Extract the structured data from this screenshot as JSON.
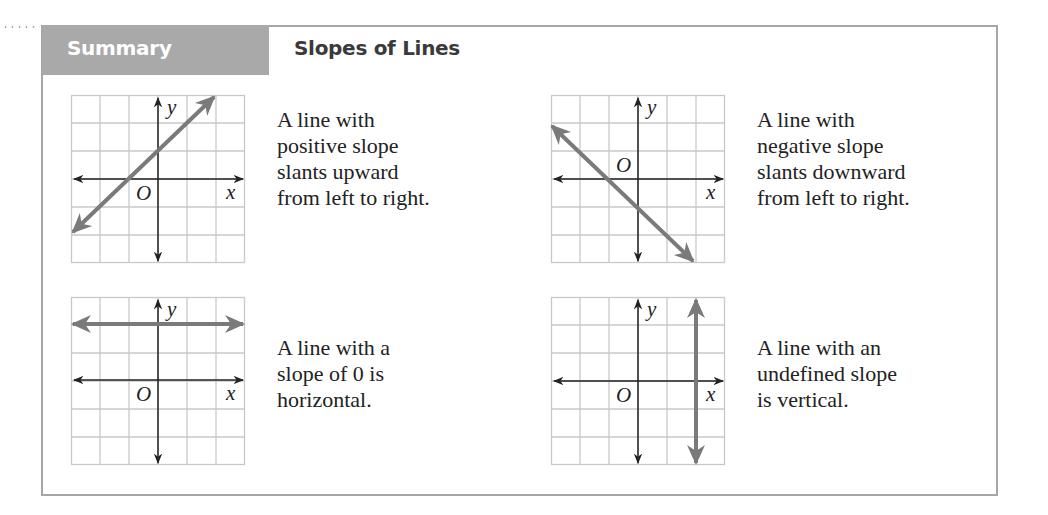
{
  "header": {
    "tab_label": "Summary",
    "title": "Slopes of Lines"
  },
  "colors": {
    "tab_bg": "#a9a9a9",
    "border": "#a6a6a6",
    "grid": "#c8c8c8",
    "axis": "#222222",
    "line": "#7a7a7a"
  },
  "panels": [
    {
      "id": "positive",
      "axis_labels": {
        "x": "x",
        "y": "y",
        "origin": "O"
      },
      "description_lines": [
        "A line with",
        "positive slope",
        "slants upward",
        "from left to right."
      ]
    },
    {
      "id": "negative",
      "axis_labels": {
        "x": "x",
        "y": "y",
        "origin": "O"
      },
      "description_lines": [
        "A line with",
        "negative slope",
        "slants downward",
        "from left to right."
      ]
    },
    {
      "id": "zero",
      "axis_labels": {
        "x": "x",
        "y": "y",
        "origin": "O"
      },
      "description_lines": [
        "A line with a",
        "slope of 0 is",
        "horizontal."
      ]
    },
    {
      "id": "undefined",
      "axis_labels": {
        "x": "x",
        "y": "y",
        "origin": "O"
      },
      "description_lines": [
        "A line with an",
        "undefined slope",
        "is vertical."
      ]
    }
  ]
}
